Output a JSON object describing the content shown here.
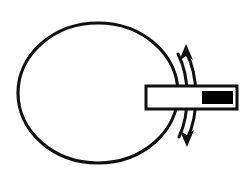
{
  "figure": {
    "background_color": "#ffffff",
    "stroke_color": "#111111",
    "fill_color": "#000000"
  },
  "shapes": {
    "ellipse": {
      "name": "disc-outline",
      "label": "Disc / wheel outline",
      "cx": 98,
      "cy": 93,
      "rx": 80,
      "ry": 70,
      "stroke_width": 3.2,
      "fill": "none",
      "stroke": "#111111"
    },
    "shaft": {
      "name": "shaft-bar",
      "label": "Horizontal shaft bar",
      "x": 146,
      "y": 86,
      "width": 91,
      "height": 23,
      "stroke_width": 3.0,
      "fill": "#ffffff",
      "stroke": "#111111"
    },
    "shaft_fill": {
      "name": "shaft-inner-fill",
      "label": "Solid black inner segment of shaft",
      "x": 202,
      "y": 91,
      "width": 31,
      "height": 13,
      "fill": "#000000"
    },
    "arrow": {
      "name": "rotation-arrow",
      "label": "Double-headed curved rotation arrow",
      "stroke_width": 3.0,
      "stroke": "#111111",
      "outer_path": "M 186 52 C 199 76 199 115 187 139",
      "inner_path": "M 178 54 C 190 77 190 114 179 137",
      "head_top_points": "186,44 193,60 186,56 179,61",
      "head_bottom_points": "187,147 180,131 187,135 194,130",
      "direction": "bidirectional"
    }
  },
  "canvas": {
    "width": 248,
    "height": 179
  }
}
